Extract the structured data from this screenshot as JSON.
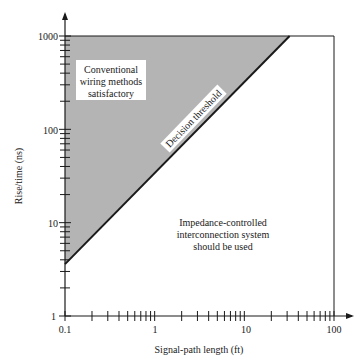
{
  "chart_data": {
    "type": "area",
    "title": "",
    "xlabel": "Signal-path length (ft)",
    "ylabel": "Rise/time (ns)",
    "xscale": "log",
    "yscale": "log",
    "xlim": [
      0.1,
      100
    ],
    "ylim": [
      1,
      1000
    ],
    "x_ticks": [
      "0.1",
      "1",
      "10",
      "100"
    ],
    "y_ticks": [
      "1",
      "10",
      "100",
      "1000"
    ],
    "grid": false,
    "legend": null,
    "series": [
      {
        "name": "Decision threshold",
        "type": "line",
        "x": [
          0.1,
          32
        ],
        "y": [
          3.6,
          1000
        ]
      }
    ],
    "regions": [
      {
        "name": "Conventional wiring methods satisfactory",
        "fill": "#b4b4b4",
        "polygon": [
          [
            0.1,
            3.6
          ],
          [
            0.1,
            1000
          ],
          [
            32,
            1000
          ]
        ]
      },
      {
        "name": "Impedance-controlled interconnection system should be used",
        "fill": "#ffffff",
        "polygon": [
          [
            0.1,
            1
          ],
          [
            0.1,
            3.6
          ],
          [
            32,
            1000
          ],
          [
            100,
            1000
          ],
          [
            100,
            1
          ]
        ]
      }
    ],
    "annotations": [
      {
        "text": "Conventional wiring methods satisfactory",
        "position": "upper-left region"
      },
      {
        "text": "Decision threshold",
        "position": "along diagonal line"
      },
      {
        "text": "Impedance-controlled interconnection system should be used",
        "position": "lower-right region"
      }
    ]
  },
  "labels": {
    "xlabel": "Signal-path length (ft)",
    "ylabel": "Rise/time (ns)",
    "threshold": "Decision threshold",
    "upper_region": [
      "Conventional",
      "wiring methods",
      "satisfactory"
    ],
    "lower_region": [
      "Impedance-controlled",
      "interconnection system",
      "should be used"
    ],
    "x_ticks": [
      "0.1",
      "1",
      "10",
      "100"
    ],
    "y_ticks": [
      "1",
      "10",
      "100",
      "1000"
    ]
  },
  "colors": {
    "shade": "#b4b4b4",
    "axis": "#1a1a1a",
    "label_bg": "#ffffff"
  }
}
